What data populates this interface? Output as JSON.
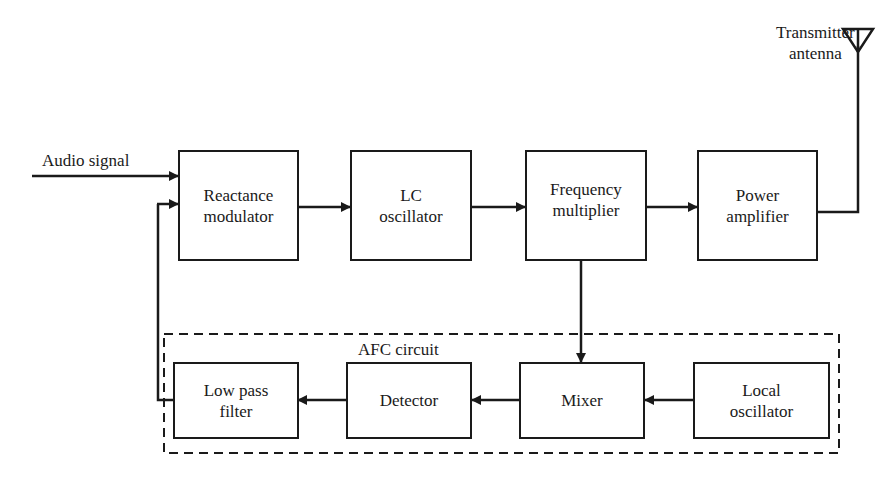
{
  "diagram": {
    "input_label": "Audio signal",
    "antenna_label": "Transmitter\nantenna",
    "afc_group_label": "AFC circuit",
    "blocks": {
      "reactance_modulator": "Reactance\nmodulator",
      "lc_oscillator": "LC\noscillator",
      "frequency_multiplier": "Frequency\nmultiplier",
      "power_amplifier": "Power\namplifier",
      "low_pass_filter": "Low pass\nfilter",
      "detector": "Detector",
      "mixer": "Mixer",
      "local_oscillator": "Local\noscillator"
    },
    "connections": [
      {
        "from": "Audio signal",
        "to": "Reactance modulator"
      },
      {
        "from": "Reactance modulator",
        "to": "LC oscillator"
      },
      {
        "from": "LC oscillator",
        "to": "Frequency multiplier"
      },
      {
        "from": "Frequency multiplier",
        "to": "Power amplifier"
      },
      {
        "from": "Power amplifier",
        "to": "Transmitter antenna"
      },
      {
        "from": "Frequency multiplier",
        "to": "Mixer"
      },
      {
        "from": "Local oscillator",
        "to": "Mixer"
      },
      {
        "from": "Mixer",
        "to": "Detector"
      },
      {
        "from": "Detector",
        "to": "Low pass filter"
      },
      {
        "from": "Low pass filter",
        "to": "Reactance modulator"
      }
    ],
    "colors": {
      "line": "#1a1a1a",
      "background": "#ffffff"
    }
  }
}
